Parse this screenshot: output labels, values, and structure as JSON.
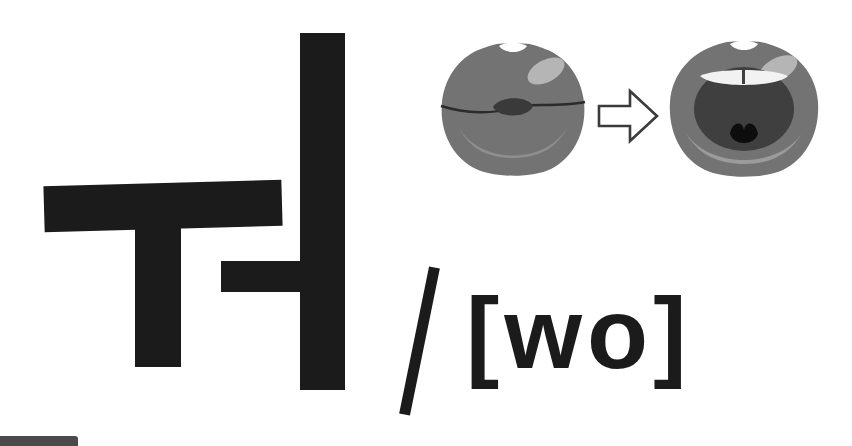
{
  "card": {
    "background_color": "#ffffff",
    "width": 852,
    "height": 446
  },
  "syllable": {
    "label": "워",
    "description": "Hangul vowel syllable composed of the strokes u and eo",
    "color": "#1b1b1b",
    "strokes": [
      {
        "name": "u-horizontal",
        "label": "ㅡ"
      },
      {
        "name": "u-stem",
        "label": "ㅜ"
      },
      {
        "name": "i-vertical",
        "label": "ㅣ"
      },
      {
        "name": "eo-spur",
        "label": "ㅓ"
      }
    ]
  },
  "separator": {
    "label": "/",
    "color": "#1b1b1b"
  },
  "phonetic": {
    "text": "[wo]",
    "open_bracket": "[",
    "close_bracket": "]",
    "value": "wo",
    "color": "#1b1b1b"
  },
  "mouth_diagram": {
    "steps": [
      {
        "name": "mouth-closed",
        "label": "rounded closed lips",
        "lip_color": "#737373",
        "highlight_color": "#b5b5b5",
        "shade_color": "#8e8e8e",
        "inner_color": "#3a3a3a",
        "line_color": "#2b2b2b"
      },
      {
        "name": "mouth-open",
        "label": "open mouth with teeth",
        "lip_color": "#737373",
        "highlight_color": "#b5b5b5",
        "shade_color": "#9b9b9b",
        "inner_color": "#3f3f3f",
        "teeth_color": "#f2f2f2",
        "tongue_color": "#0d0d0d"
      }
    ],
    "arrow": {
      "label": "arrow-right",
      "fill": "#ffffff",
      "stroke": "#3b3b3b"
    }
  },
  "corner_marker": {
    "label": "cropped-bar",
    "color": "#4a4a4a"
  }
}
